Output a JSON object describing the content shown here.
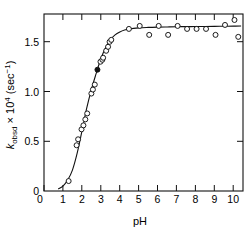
{
  "figure": {
    "background_color": "#ffffff",
    "ink_color": "#111111",
    "frame": {
      "left": 44,
      "right": 243,
      "top": 14,
      "bottom": 191
    }
  },
  "axes": {
    "x": {
      "title": "pH",
      "min": 0,
      "max": 10.5,
      "ticks": [
        0,
        1,
        2,
        3,
        4,
        5,
        6,
        7,
        8,
        9,
        10
      ],
      "tick_labels": [
        "0",
        "1",
        "2",
        "3",
        "4",
        "5",
        "6",
        "7",
        "8",
        "9",
        "10"
      ],
      "tick_direction": "in",
      "mirror_top": true
    },
    "y": {
      "title_parts": {
        "symbol": "k",
        "subscript": "obsd",
        "multiplier": " × 10",
        "exponent": "4",
        "units_open": " (sec",
        "units_exponent": "−1",
        "units_close": ")"
      },
      "title_plain": "kobsd × 10⁴ (sec⁻¹)",
      "min": 0,
      "max": 1.78,
      "ticks": [
        0,
        0.5,
        1.0,
        1.5
      ],
      "tick_labels": [
        "0",
        "0.5",
        "1.0",
        "1.5"
      ],
      "tick_direction": "in",
      "mirror_right": true
    }
  },
  "chart_data": {
    "type": "scatter",
    "title": "",
    "subtitle": "",
    "xlabel": "pH",
    "ylabel": "kobsd × 10⁴ (sec⁻¹)",
    "xlim": [
      0,
      10.5
    ],
    "ylim": [
      0,
      1.78
    ],
    "grid": false,
    "legend": false,
    "legend_position": "none",
    "annotations": [],
    "series": [
      {
        "name": "k_obsd (open circles)",
        "marker": "open-circle",
        "x": [
          1.3,
          1.72,
          1.8,
          1.98,
          2.08,
          2.18,
          2.28,
          2.5,
          2.58,
          2.68,
          2.98,
          3.08,
          3.12,
          3.28,
          3.38,
          3.46,
          3.55,
          4.48,
          5.05,
          5.55,
          6.05,
          6.55,
          7.05,
          7.55,
          8.05,
          8.55,
          9.05,
          9.55,
          10.05,
          10.25
        ],
        "y": [
          0.1,
          0.46,
          0.52,
          0.62,
          0.66,
          0.72,
          0.78,
          0.98,
          1.02,
          1.07,
          1.3,
          1.32,
          1.34,
          1.41,
          1.45,
          1.5,
          1.52,
          1.63,
          1.66,
          1.57,
          1.66,
          1.57,
          1.66,
          1.63,
          1.63,
          1.63,
          1.57,
          1.67,
          1.72,
          1.55
        ]
      },
      {
        "name": "k_obsd (filled circle)",
        "marker": "filled-circle",
        "x": [
          2.82
        ],
        "y": [
          1.22
        ]
      }
    ],
    "fit_curve": {
      "name": "sigmoidal fit",
      "description": "titration-type rate profile, inflection near pH 2.8",
      "x": [
        0.75,
        1.0,
        1.25,
        1.5,
        1.75,
        2.0,
        2.25,
        2.5,
        2.75,
        3.0,
        3.25,
        3.5,
        3.75,
        4.0,
        4.25,
        4.5,
        5.0,
        5.5,
        6.0,
        6.5,
        7.0,
        7.5,
        8.0,
        8.5,
        9.0,
        9.5,
        10.0,
        10.4
      ],
      "y": [
        0.02,
        0.05,
        0.11,
        0.21,
        0.38,
        0.6,
        0.83,
        1.02,
        1.18,
        1.33,
        1.44,
        1.52,
        1.57,
        1.6,
        1.62,
        1.63,
        1.64,
        1.645,
        1.648,
        1.65,
        1.652,
        1.653,
        1.654,
        1.655,
        1.656,
        1.657,
        1.658,
        1.659
      ]
    }
  }
}
